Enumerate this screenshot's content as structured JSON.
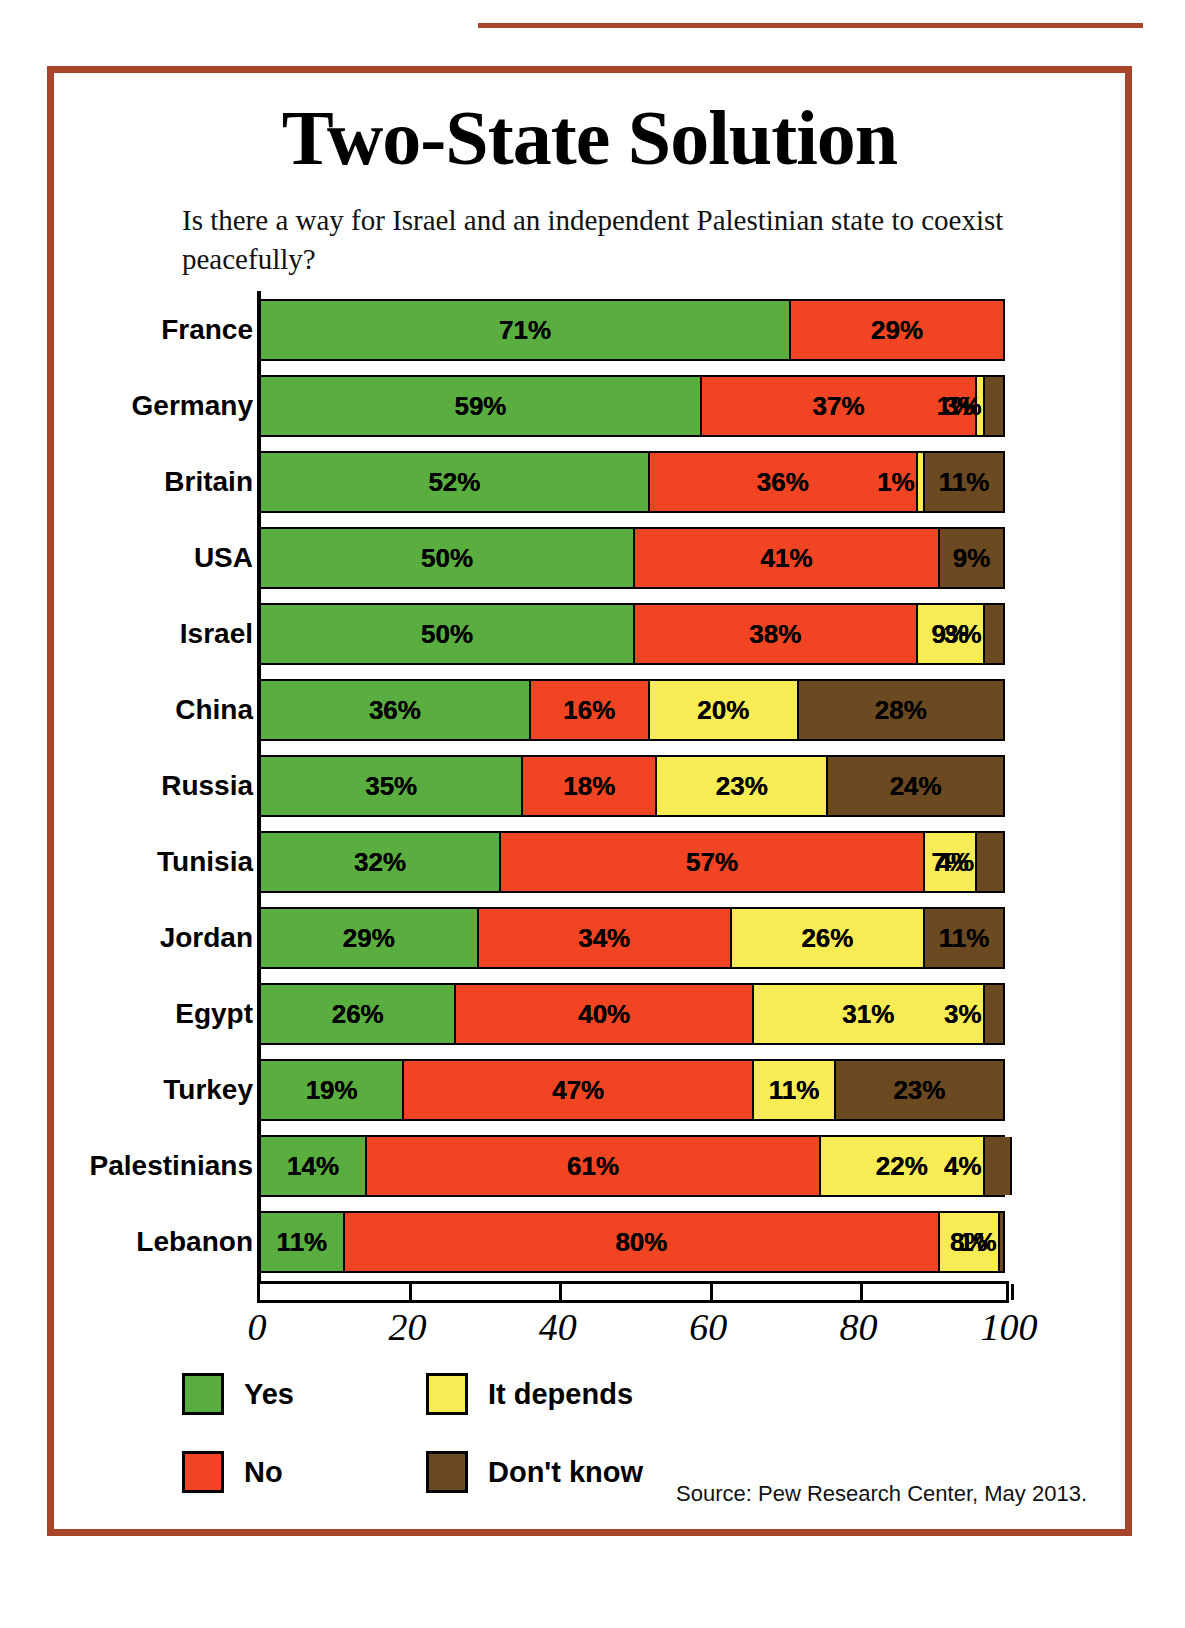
{
  "page_header": {
    "running_head": "",
    "page_number": ""
  },
  "figure": {
    "title": "Two-State Solution",
    "subtitle": "Is there a way for Israel and an independent Palestinian state to coexist peacefully?",
    "source": "Source: Pew Research Center, May 2013.",
    "border_color": "#a8442a"
  },
  "legend": {
    "items": [
      {
        "label": "Yes",
        "color": "#5aad3f",
        "key": "yes"
      },
      {
        "label": "No",
        "color": "#f04423",
        "key": "no"
      },
      {
        "label": "It depends",
        "color": "#f7ec54",
        "key": "depends"
      },
      {
        "label": "Don't know",
        "color": "#6b4a22",
        "key": "dont_know"
      }
    ]
  },
  "chart_data": {
    "type": "bar",
    "orientation": "horizontal",
    "stacked": true,
    "title": "Two-State Solution",
    "subtitle": "Is there a way for Israel and an independent Palestinian state to coexist peacefully?",
    "xlabel": "",
    "ylabel": "",
    "xlim": [
      0,
      100
    ],
    "xticks": [
      0,
      20,
      40,
      60,
      80,
      100
    ],
    "xtick_labels": [
      "0",
      "20",
      "40",
      "60",
      "80",
      "100"
    ],
    "value_suffix": "%",
    "grid": false,
    "legend_position": "bottom-left",
    "series": [
      {
        "name": "Yes",
        "color": "#5aad3f",
        "values": [
          71,
          59,
          52,
          50,
          50,
          36,
          35,
          32,
          29,
          26,
          19,
          14,
          11
        ]
      },
      {
        "name": "No",
        "color": "#f04423",
        "values": [
          29,
          37,
          36,
          41,
          38,
          16,
          18,
          57,
          34,
          40,
          47,
          61,
          80
        ]
      },
      {
        "name": "It depends",
        "color": "#f7ec54",
        "values": [
          0,
          1,
          1,
          0,
          9,
          20,
          23,
          7,
          26,
          31,
          11,
          22,
          8
        ]
      },
      {
        "name": "Don't know",
        "color": "#6b4a22",
        "values": [
          0,
          3,
          11,
          9,
          3,
          28,
          24,
          4,
          11,
          3,
          23,
          4,
          1
        ]
      }
    ],
    "categories": [
      "France",
      "Germany",
      "Britain",
      "USA",
      "Israel",
      "China",
      "Russia",
      "Tunisia",
      "Jordan",
      "Egypt",
      "Turkey",
      "Palestinians",
      "Lebanon"
    ],
    "rows": [
      {
        "country": "France",
        "yes": 71,
        "no": 29,
        "depends": 0,
        "dont_know": 0,
        "labels": {
          "yes": "71%",
          "no": "29%",
          "depends": "",
          "dont_know": ""
        }
      },
      {
        "country": "Germany",
        "yes": 59,
        "no": 37,
        "depends": 1,
        "dont_know": 3,
        "labels": {
          "yes": "59%",
          "no": "37%",
          "depends": "1%",
          "dont_know": "3%"
        }
      },
      {
        "country": "Britain",
        "yes": 52,
        "no": 36,
        "depends": 1,
        "dont_know": 11,
        "labels": {
          "yes": "52%",
          "no": "36%",
          "depends": "1%",
          "dont_know": "11%"
        }
      },
      {
        "country": "USA",
        "yes": 50,
        "no": 41,
        "depends": 0,
        "dont_know": 9,
        "labels": {
          "yes": "50%",
          "no": "41%",
          "depends": "",
          "dont_know": "9%"
        }
      },
      {
        "country": "Israel",
        "yes": 50,
        "no": 38,
        "depends": 9,
        "dont_know": 3,
        "labels": {
          "yes": "50%",
          "no": "38%",
          "depends": "9%",
          "dont_know": "3%"
        }
      },
      {
        "country": "China",
        "yes": 36,
        "no": 16,
        "depends": 20,
        "dont_know": 28,
        "labels": {
          "yes": "36%",
          "no": "16%",
          "depends": "20%",
          "dont_know": "28%"
        }
      },
      {
        "country": "Russia",
        "yes": 35,
        "no": 18,
        "depends": 23,
        "dont_know": 24,
        "labels": {
          "yes": "35%",
          "no": "18%",
          "depends": "23%",
          "dont_know": "24%"
        }
      },
      {
        "country": "Tunisia",
        "yes": 32,
        "no": 57,
        "depends": 7,
        "dont_know": 4,
        "labels": {
          "yes": "32%",
          "no": "57%",
          "depends": "7%",
          "dont_know": "4%"
        }
      },
      {
        "country": "Jordan",
        "yes": 29,
        "no": 34,
        "depends": 26,
        "dont_know": 11,
        "labels": {
          "yes": "29%",
          "no": "34%",
          "depends": "26%",
          "dont_know": "11%"
        }
      },
      {
        "country": "Egypt",
        "yes": 26,
        "no": 40,
        "depends": 31,
        "dont_know": 3,
        "labels": {
          "yes": "26%",
          "no": "40%",
          "depends": "31%",
          "dont_know": "3%"
        }
      },
      {
        "country": "Turkey",
        "yes": 19,
        "no": 47,
        "depends": 11,
        "dont_know": 23,
        "labels": {
          "yes": "19%",
          "no": "47%",
          "depends": "11%",
          "dont_know": "23%"
        }
      },
      {
        "country": "Palestinians",
        "yes": 14,
        "no": 61,
        "depends": 22,
        "dont_know": 4,
        "labels": {
          "yes": "14%",
          "no": "61%",
          "depends": "22%",
          "dont_know": "4%"
        }
      },
      {
        "country": "Lebanon",
        "yes": 11,
        "no": 80,
        "depends": 8,
        "dont_know": 1,
        "labels": {
          "yes": "11%",
          "no": "80%",
          "depends": "8%",
          "dont_know": "1%"
        }
      }
    ]
  }
}
